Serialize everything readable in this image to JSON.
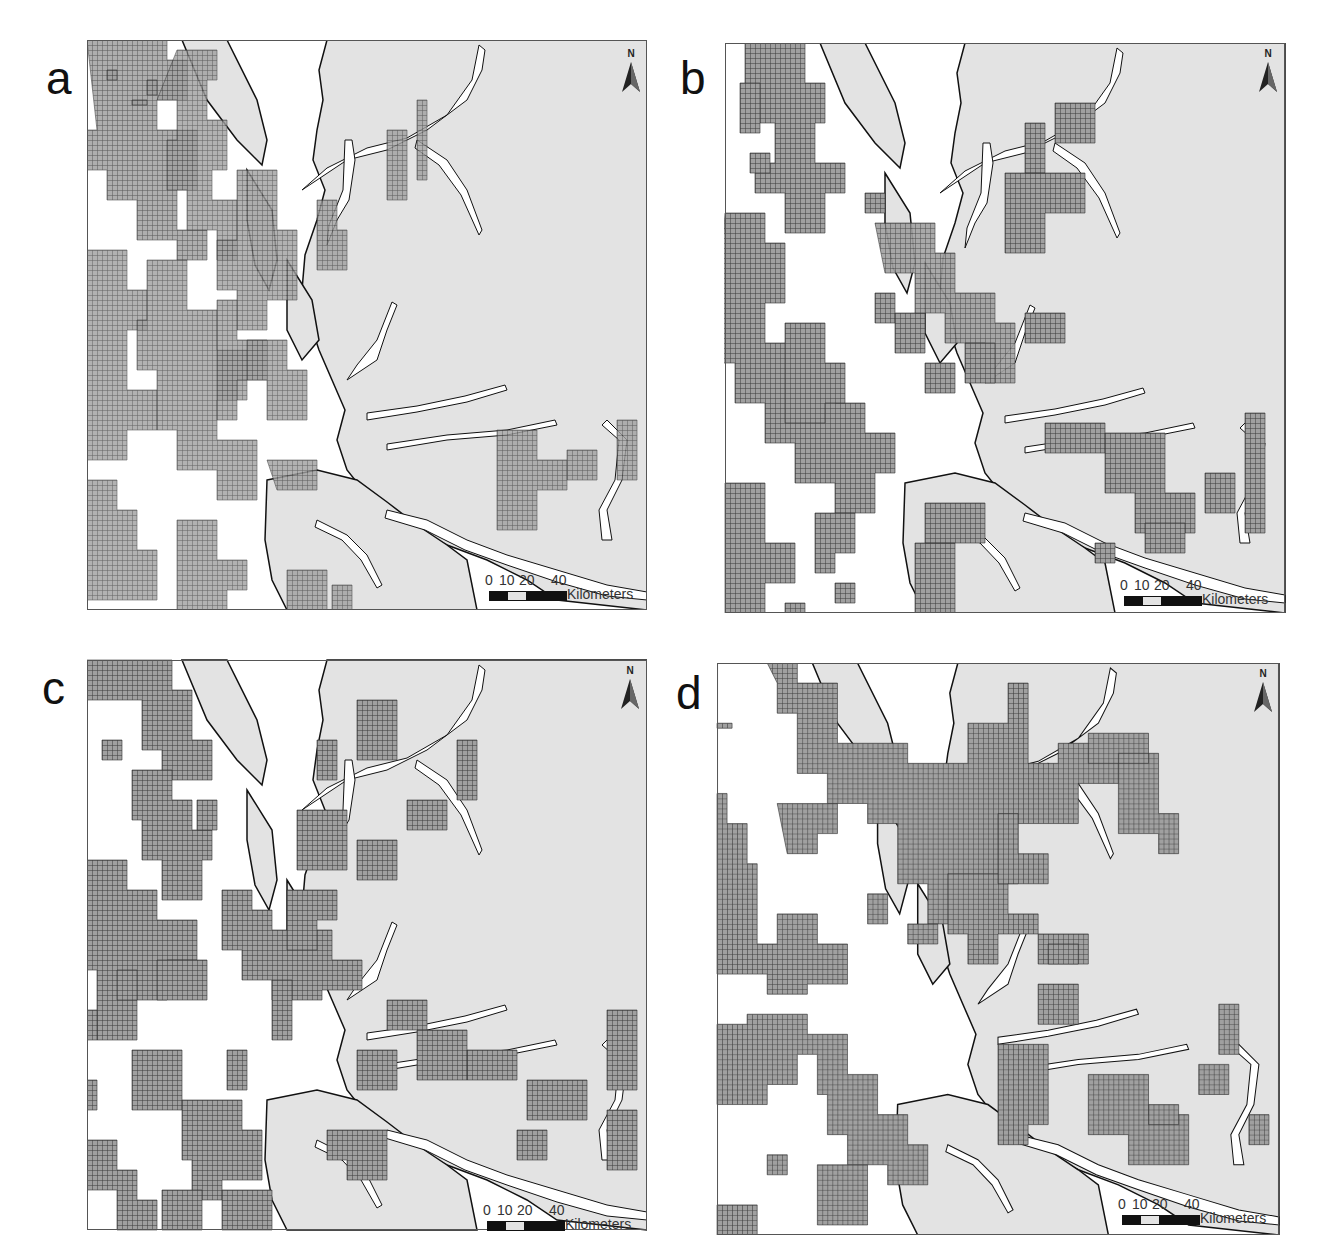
{
  "figure": {
    "panels": [
      {
        "id": "a",
        "label": "a",
        "description": "Fine-scattered grid cells (small clusters) across seaward areas",
        "north_label": "N",
        "scale": {
          "ticks": [
            "0",
            "10",
            "20",
            "40"
          ],
          "unit": "Kilometers"
        }
      },
      {
        "id": "b",
        "label": "b",
        "description": "Medium-sized clustered grid patches",
        "north_label": "N",
        "scale": {
          "ticks": [
            "0",
            "10",
            "20",
            "40"
          ],
          "unit": "Kilometers"
        }
      },
      {
        "id": "c",
        "label": "c",
        "description": "Larger contiguous grid blobs",
        "north_label": "N",
        "scale": {
          "ticks": [
            "0",
            "10",
            "20",
            "40"
          ],
          "unit": "Kilometers"
        }
      },
      {
        "id": "d",
        "label": "d",
        "description": "Large contiguous grid regions",
        "north_label": "N",
        "scale": {
          "ticks": [
            "0",
            "10",
            "20",
            "40"
          ],
          "unit": "Kilometers"
        }
      }
    ],
    "colors": {
      "land": "#e3e3e3",
      "water": "#ffffff",
      "coastline": "#111111",
      "grid_fill": "#8a8a8a",
      "grid_line": "#333333",
      "frame": "#555555",
      "scale_dark": "#111111",
      "scale_light": "#e3e3e3"
    }
  }
}
